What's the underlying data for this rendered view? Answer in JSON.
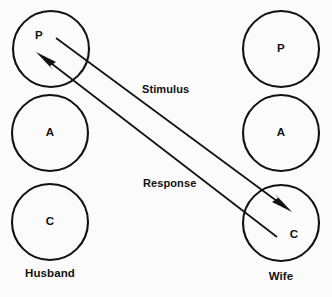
{
  "diagram": {
    "background_color": "#fbfbfb",
    "ink_color": "#111111",
    "columns": [
      {
        "key": "husband",
        "label": "Husband",
        "label_x": 50,
        "label_y": 274,
        "center_x": 50,
        "states": [
          {
            "letter": "P",
            "name": "parent",
            "cx": 51,
            "cy": 49,
            "r": 38
          },
          {
            "letter": "A",
            "name": "adult",
            "cx": 50,
            "cy": 133,
            "r": 38
          },
          {
            "letter": "C",
            "name": "child",
            "cx": 50,
            "cy": 222,
            "r": 38
          }
        ]
      },
      {
        "key": "wife",
        "label": "Wife",
        "label_x": 281,
        "label_y": 277,
        "center_x": 281,
        "states": [
          {
            "letter": "P",
            "name": "parent",
            "cx": 281,
            "cy": 49,
            "r": 38
          },
          {
            "letter": "A",
            "name": "adult",
            "cx": 281,
            "cy": 133,
            "r": 38
          },
          {
            "letter": "C",
            "name": "child",
            "cx": 281,
            "cy": 223,
            "r": 38
          }
        ]
      }
    ],
    "transactions": [
      {
        "key": "stimulus",
        "label": "Stimulus",
        "from": "husband-parent",
        "to": "wife-child",
        "x1": 56,
        "y1": 38,
        "x2": 292,
        "y2": 212,
        "label_x": 142,
        "label_y": 90
      },
      {
        "key": "response",
        "label": "Response",
        "from": "wife-child",
        "to": "husband-parent",
        "x1": 277,
        "y1": 237,
        "x2": 36,
        "y2": 52,
        "label_x": 143,
        "label_y": 184
      }
    ]
  }
}
